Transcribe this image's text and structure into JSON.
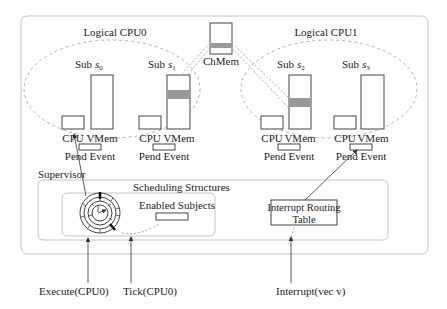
{
  "diagram": {
    "logical_cpus": [
      {
        "label": "Logical CPU0",
        "subjects": [
          {
            "label_prefix": "Sub",
            "var": "s",
            "sub": "0",
            "cpu_label": "CPU",
            "vmem_label": "VMem",
            "pend_label": "Pend Event",
            "shared_region": false
          },
          {
            "label_prefix": "Sub",
            "var": "s",
            "sub": "1",
            "cpu_label": "CPU",
            "vmem_label": "VMem",
            "pend_label": "Pend Event",
            "shared_region": true
          }
        ]
      },
      {
        "label": "Logical CPU1",
        "subjects": [
          {
            "label_prefix": "Sub",
            "var": "s",
            "sub": "2",
            "cpu_label": "CPU",
            "vmem_label": "VMem",
            "pend_label": "Pend Event",
            "shared_region": true
          },
          {
            "label_prefix": "Sub",
            "var": "s",
            "sub": "3",
            "cpu_label": "CPU",
            "vmem_label": "VMem",
            "pend_label": "Pend Event",
            "shared_region": false
          }
        ]
      }
    ],
    "channel_memory": {
      "label": "ChMem"
    },
    "supervisor": {
      "label": "Supervisor",
      "scheduling": {
        "label": "Scheduling Structures",
        "enabled_subjects_label": "Enabled Subjects"
      },
      "interrupt_routing": {
        "line1": "Interrupt Routing",
        "line2": "Table"
      }
    },
    "inputs": [
      {
        "label": "Execute(CPU0)"
      },
      {
        "label": "Tick(CPU0)"
      },
      {
        "label": "Interrupt(vec v)"
      }
    ],
    "colors": {
      "stroke": "#333333",
      "dashed": "#aaaaaa",
      "shared_fill": "#999999",
      "box_border": "#bbbbbb"
    }
  }
}
